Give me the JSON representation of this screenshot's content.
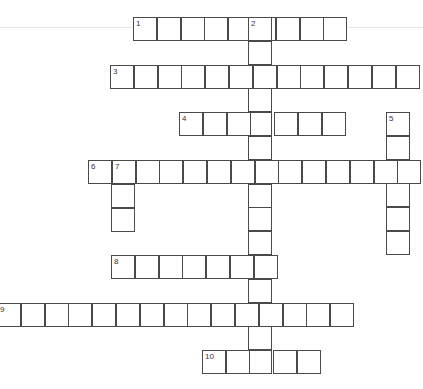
{
  "puzzle": {
    "cell_size": 23.8,
    "border_color": "#4a4a4a",
    "words": [
      {
        "number": "1",
        "direction": "across",
        "x": 133,
        "y": 17,
        "length": 9
      },
      {
        "number": "2",
        "direction": "down",
        "x": 248,
        "y": 17,
        "length": 15
      },
      {
        "number": "3",
        "direction": "across",
        "x": 110,
        "y": 65,
        "length": 13
      },
      {
        "number": "4",
        "direction": "across",
        "x": 179,
        "y": 112,
        "length": 7
      },
      {
        "number": "5",
        "direction": "down",
        "x": 386,
        "y": 112,
        "length": 6
      },
      {
        "number": "6",
        "direction": "across",
        "x": 88,
        "y": 160,
        "length": 14
      },
      {
        "number": "7",
        "direction": "down",
        "x": 111,
        "y": 160,
        "length": 3
      },
      {
        "number": "8",
        "direction": "across",
        "x": 111,
        "y": 255,
        "length": 7
      },
      {
        "number": "9",
        "direction": "across",
        "x": -3,
        "y": 303,
        "length": 15
      },
      {
        "number": "10",
        "direction": "across",
        "x": 202,
        "y": 350,
        "length": 5
      }
    ]
  }
}
